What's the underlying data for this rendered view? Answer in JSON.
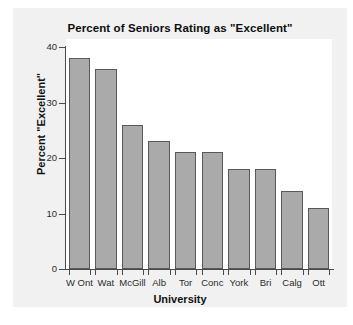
{
  "chart_data": {
    "type": "bar",
    "title": "Percent of Seniors Rating as \"Excellent\"",
    "xlabel": "University",
    "ylabel": "Percent \"Excellent\"",
    "categories": [
      "W Ont",
      "Wat",
      "McGill",
      "Alb",
      "Tor",
      "Conc",
      "York",
      "Bri",
      "Calg",
      "Ott"
    ],
    "values": [
      38,
      36,
      26,
      23,
      21,
      21,
      18,
      18,
      14,
      11
    ],
    "ylim": [
      0,
      40
    ],
    "yticks": [
      0,
      10,
      20,
      30,
      40
    ],
    "ytick_labels": [
      "0",
      "10",
      "20",
      "30",
      "40"
    ],
    "grid": false,
    "legend": false,
    "bar_color": "#aaaaaa",
    "bar_edge_color": "#595959",
    "panel_color": "#ffffff",
    "figure_color": "#f1f1f1"
  }
}
